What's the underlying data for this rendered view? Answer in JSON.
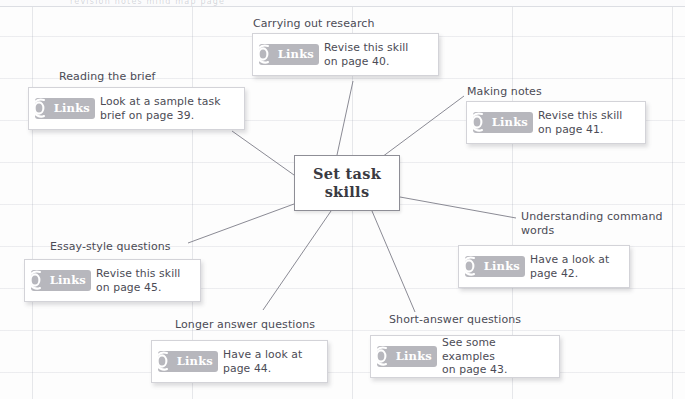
{
  "page": {
    "ghost_top_text": "revision notes mind map page",
    "background_color": "#fdfdfd",
    "grid_color": "#969baa",
    "card_border_color": "#d3d3d8",
    "badge_color": "#b7b7bd",
    "text_color": "#4b4b55",
    "node_border_color": "#8e8e96"
  },
  "center": {
    "label": "Set task\nskills"
  },
  "badge": {
    "word": "Links",
    "icon": "chain-link-icon"
  },
  "branches": [
    {
      "id": "carrying-out-research",
      "label": "Carrying out research",
      "card_text": "Revise this skill\non page 40.",
      "page": "40"
    },
    {
      "id": "reading-the-brief",
      "label": "Reading the brief",
      "card_text": "Look at a sample task\nbrief on page 39.",
      "page": "39"
    },
    {
      "id": "making-notes",
      "label": "Making notes",
      "card_text": "Revise this skill\non page 41.",
      "page": "41"
    },
    {
      "id": "understanding-command-words",
      "label": "Understanding command\nwords",
      "card_text": "Have a look at\npage 42.",
      "page": "42"
    },
    {
      "id": "short-answer-questions",
      "label": "Short-answer questions",
      "card_text": "See some examples\non page 43.",
      "page": "43"
    },
    {
      "id": "longer-answer-questions",
      "label": "Longer answer questions",
      "card_text": "Have a look at\npage 44.",
      "page": "44"
    },
    {
      "id": "essay-style-questions",
      "label": "Essay-style questions",
      "card_text": "Revise this skill\non page 45.",
      "page": "45"
    }
  ]
}
